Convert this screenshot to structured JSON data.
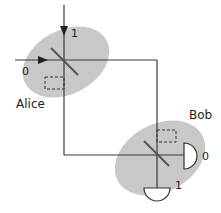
{
  "diagram": {
    "colors": {
      "lab_fill": "#c8c8c8",
      "line": "#3a3a3a",
      "detector_fill": "#ffffff"
    },
    "alice": {
      "label": "Alice",
      "port_labels": {
        "horizontal": "0",
        "vertical": "1"
      }
    },
    "bob": {
      "label": "Bob",
      "detector_labels": {
        "right": "0",
        "bottom": "1"
      }
    }
  }
}
